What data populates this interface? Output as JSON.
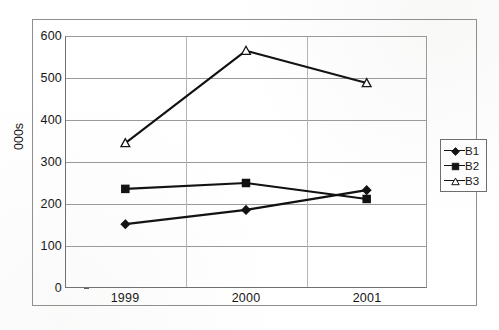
{
  "chart_data": {
    "type": "line",
    "title": "",
    "subtitle": "",
    "xlabel": "",
    "ylabel": "000s",
    "categories": [
      "1999",
      "2000",
      "2001"
    ],
    "ylim": [
      0,
      600
    ],
    "y_ticks": [
      "600",
      "500",
      "400",
      "300",
      "200",
      "100",
      "0"
    ],
    "grid": true,
    "legend_position": "right",
    "series": [
      {
        "name": "B1",
        "marker": "diamond",
        "marker_fill": "#111111",
        "color": "#111111",
        "values": [
          152,
          186,
          233
        ]
      },
      {
        "name": "B2",
        "marker": "square",
        "marker_fill": "#111111",
        "color": "#111111",
        "values": [
          236,
          250,
          212
        ]
      },
      {
        "name": "B3",
        "marker": "triangle",
        "marker_fill": "#ffffff",
        "color": "#111111",
        "values": [
          345,
          565,
          488
        ]
      }
    ]
  },
  "legend": {
    "entries": [
      {
        "label": "B1"
      },
      {
        "label": "B2"
      },
      {
        "label": "B3"
      }
    ]
  },
  "axes": {
    "y_title": "000s",
    "y_ticks": [
      "600",
      "500",
      "400",
      "300",
      "200",
      "100",
      "0"
    ],
    "x_ticks": [
      "1999",
      "2000",
      "2001"
    ]
  },
  "colors": {
    "series_line": "#111111",
    "gridline": "#9a9a9a",
    "axis": "#6f6f6f",
    "frame": "#8e8e8e",
    "background": "#ffffff",
    "text": "#141414"
  }
}
